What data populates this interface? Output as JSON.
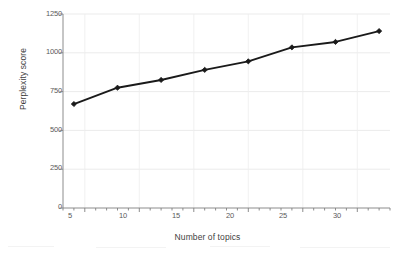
{
  "chart_data": {
    "type": "line",
    "title": "",
    "xlabel": "Number of topics",
    "ylabel": "Perplexity score",
    "x": [
      4,
      8,
      12,
      16,
      20,
      24,
      28,
      32
    ],
    "values": [
      670,
      775,
      825,
      890,
      945,
      1035,
      1070,
      1140
    ],
    "series": [
      {
        "name": "Perplexity score",
        "values": [
          670,
          775,
          825,
          890,
          945,
          1035,
          1070,
          1140
        ]
      }
    ],
    "xlim": [
      3,
      33
    ],
    "ylim": [
      0,
      1250
    ],
    "xticks": [
      5,
      10,
      15,
      20,
      25,
      30
    ],
    "yticks": [
      0,
      250,
      500,
      750,
      1000,
      1250
    ],
    "xtick_labels": [
      "5",
      "10",
      "15",
      "20",
      "25",
      "30"
    ],
    "ytick_labels": [
      "0",
      "250",
      "500",
      "750",
      "1000",
      "1250"
    ],
    "x_minor_tick_step": 1,
    "grid": true,
    "grid_color": "#e6e6e6",
    "legend": false,
    "legend_position": "none",
    "line_color": "#1a1a1a",
    "marker": "diamond",
    "marker_color": "#1a1a1a",
    "axis_color": "#808080"
  },
  "axes": {
    "y_title": "Perplexity score",
    "x_title": "Number of topics"
  }
}
